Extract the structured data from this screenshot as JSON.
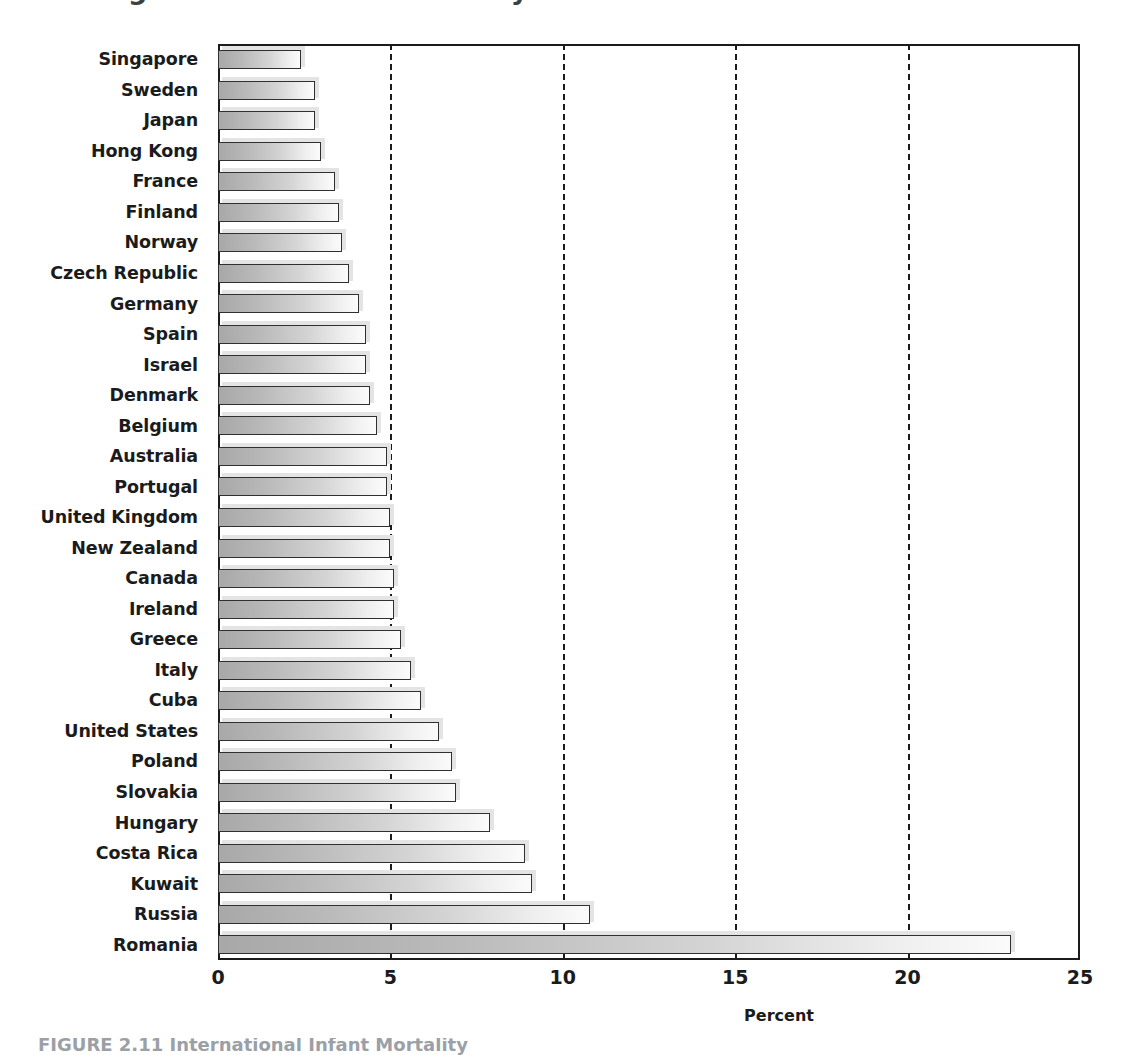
{
  "figure": {
    "title_cropped": "Figure 2.11 Infant Mortality",
    "caption_cropped": "FIGURE 2.11 International Infant Mortality",
    "xaxis_title": "Percent"
  },
  "chart_data": {
    "type": "bar",
    "orientation": "horizontal",
    "title": "International Infant Mortality",
    "xlabel": "Percent",
    "ylabel": "",
    "xlim": [
      0,
      25
    ],
    "xticks": [
      "0",
      "5",
      "10",
      "15",
      "20",
      "25"
    ],
    "xtick_values": [
      0,
      5,
      10,
      15,
      20,
      25
    ],
    "gridlines_at": [
      5,
      10,
      15,
      20
    ],
    "grid": true,
    "legend": false,
    "categories": [
      "Singapore",
      "Sweden",
      "Japan",
      "Hong Kong",
      "France",
      "Finland",
      "Norway",
      "Czech Republic",
      "Germany",
      "Spain",
      "Israel",
      "Denmark",
      "Belgium",
      "Australia",
      "Portugal",
      "United Kingdom",
      "New Zealand",
      "Canada",
      "Ireland",
      "Greece",
      "Italy",
      "Cuba",
      "United States",
      "Poland",
      "Slovakia",
      "Hungary",
      "Costa Rica",
      "Kuwait",
      "Russia",
      "Romania"
    ],
    "values": [
      2.4,
      2.8,
      2.8,
      3.0,
      3.4,
      3.5,
      3.6,
      3.8,
      4.1,
      4.3,
      4.3,
      4.4,
      4.6,
      4.9,
      4.9,
      5.0,
      5.0,
      5.1,
      5.1,
      5.3,
      5.6,
      5.9,
      6.4,
      6.8,
      6.9,
      7.9,
      8.9,
      9.1,
      10.8,
      23.0
    ]
  },
  "colors": {
    "bar_dark": "#a8a8a8",
    "bar_light": "#fbfbfb",
    "bar_outline": "#303030",
    "bar_shadow": "#e4e4e4",
    "axis": "#1b1b1b",
    "text": "#1b1b1b",
    "caption_text": "#9aa0a6"
  }
}
